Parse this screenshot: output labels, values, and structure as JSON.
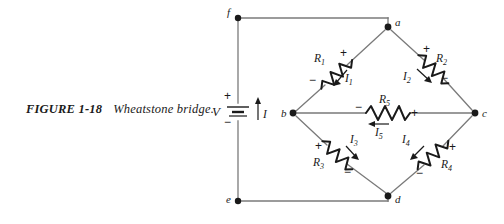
{
  "caption": {
    "number": "FIGURE 1-18",
    "title": "Wheatstone bridge."
  },
  "colors": {
    "wire": "#7a7a7a",
    "ink": "#1a1a1a",
    "background": "#ffffff"
  },
  "source": {
    "symbol_name": "battery",
    "label": "V",
    "plus": "+",
    "minus": "−",
    "current_label": "I",
    "current_direction": "up"
  },
  "nodes": [
    {
      "id": "f",
      "label": "f",
      "x": 232,
      "y": 14
    },
    {
      "id": "a",
      "label": "a",
      "x": 388,
      "y": 27
    },
    {
      "id": "b",
      "label": "b",
      "x": 293,
      "y": 113
    },
    {
      "id": "c",
      "label": "c",
      "x": 475,
      "y": 113
    },
    {
      "id": "d",
      "label": "d",
      "x": 388,
      "y": 196
    },
    {
      "id": "e",
      "label": "e",
      "x": 232,
      "y": 205
    }
  ],
  "components": [
    {
      "id": "R1",
      "label": "R",
      "subscript": "1",
      "between": [
        "a",
        "b"
      ],
      "plus": "+",
      "minus": "−",
      "current_label": "I",
      "current_subscript": "1"
    },
    {
      "id": "R2",
      "label": "R",
      "subscript": "2",
      "between": [
        "a",
        "c"
      ],
      "plus": "+",
      "minus": "−",
      "current_label": "I",
      "current_subscript": "2"
    },
    {
      "id": "R5",
      "label": "R",
      "subscript": "5",
      "between": [
        "b",
        "c"
      ],
      "plus": "+",
      "minus": "−",
      "current_label": "I",
      "current_subscript": "5"
    },
    {
      "id": "R3",
      "label": "R",
      "subscript": "3",
      "between": [
        "b",
        "d"
      ],
      "plus": "+",
      "minus": "−",
      "current_label": "I",
      "current_subscript": "3"
    },
    {
      "id": "R4",
      "label": "R",
      "subscript": "4",
      "between": [
        "c",
        "d"
      ],
      "plus": "+",
      "minus": "−",
      "current_label": "I",
      "current_subscript": "4"
    }
  ]
}
